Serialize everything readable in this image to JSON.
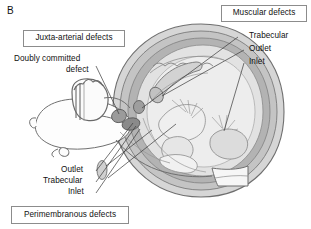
{
  "figure": {
    "panel_letter": "B",
    "background_color": "#ffffff",
    "line_color": "#5a5a5a",
    "box_border_color": "#8c8c8c",
    "text_color": "#111111"
  },
  "boxed_labels": {
    "juxta_arterial": "Juxta-arterial defects",
    "muscular": "Muscular defects",
    "perimembranous": "Perimembranous defects"
  },
  "plain_labels": {
    "doubly_committed_line1": "Doubly committed",
    "doubly_committed_line2": "defect",
    "muscular_trabecular": "Trabecular",
    "muscular_outlet": "Outlet",
    "muscular_inlet": "Inlet",
    "perimembranous_outlet": "Outlet",
    "perimembranous_trabecular": "Trabecular",
    "perimembranous_inlet": "Inlet"
  },
  "diagram": {
    "fills": {
      "outer_myocardium": "#cfcfcf",
      "mid_myocardium": "#b9b9b9",
      "inner_cavity": "#e4e4e4",
      "pale_cavity": "#efefef",
      "defect_marker": "#9a9a9a",
      "dark_defect_marker": "#8a8a8a",
      "vessel_white": "#fbfbfb"
    }
  }
}
